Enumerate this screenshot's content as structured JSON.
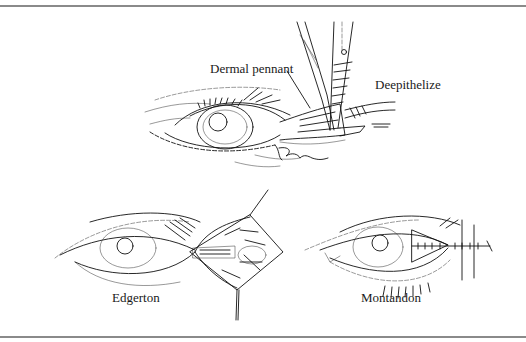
{
  "figure": {
    "panels": [
      {
        "id": "top",
        "labels": {
          "dermal_pennant": "Dermal pennant",
          "deepithelize": "Deepithelize"
        },
        "signature": "signature"
      },
      {
        "id": "bottom-left",
        "labels": {
          "technique": "Edgerton"
        }
      },
      {
        "id": "bottom-right",
        "labels": {
          "technique": "Montandon"
        }
      }
    ]
  }
}
